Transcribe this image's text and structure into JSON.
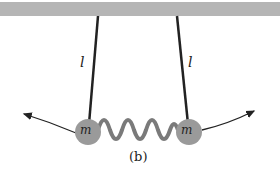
{
  "diagram": {
    "type": "coupled-pendulums",
    "ceiling": {
      "color": "#b5b5b5"
    },
    "pendulums": [
      {
        "length_label": "l",
        "mass_label": "m"
      },
      {
        "length_label": "l",
        "mass_label": "m"
      }
    ],
    "spring": {
      "color": "#7a7a7a"
    },
    "mass_color": "#9a9a9a",
    "caption": "(b)"
  }
}
